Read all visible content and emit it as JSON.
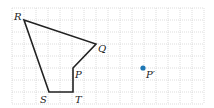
{
  "diagram": {
    "type": "grid-polygon",
    "grid": {
      "x0": 12,
      "y0": 8,
      "cell": 12,
      "cols": 16,
      "rows": 8,
      "color": "#c8c8c8"
    },
    "polygon": {
      "stroke": "#222222",
      "vertices": [
        {
          "name": "R",
          "label": "R",
          "x": 24,
          "y": 20,
          "lx": 14,
          "ly": 20
        },
        {
          "name": "Q",
          "label": "Q",
          "x": 96,
          "y": 44,
          "lx": 98,
          "ly": 52
        },
        {
          "name": "P",
          "label": "P",
          "x": 73,
          "y": 68,
          "lx": 75,
          "ly": 78
        },
        {
          "name": "T",
          "label": "T",
          "x": 73,
          "y": 92,
          "lx": 75,
          "ly": 103
        },
        {
          "name": "S",
          "label": "S",
          "x": 49,
          "y": 92,
          "lx": 40,
          "ly": 103
        }
      ]
    },
    "point": {
      "name": "P'",
      "label": "P′",
      "x": 143,
      "y": 68,
      "lx": 146,
      "ly": 78,
      "color": "#1f77b4"
    }
  }
}
